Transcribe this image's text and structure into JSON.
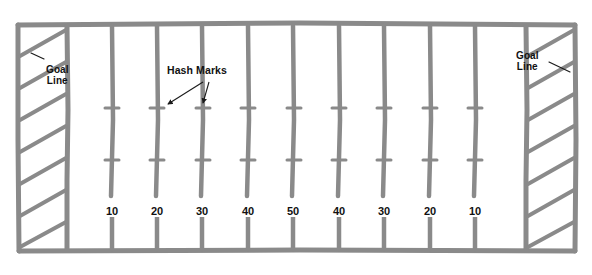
{
  "diagram": {
    "type": "football-field-plan",
    "colors": {
      "line": "#8a8a8a",
      "line_dark": "#7b7b7b",
      "background": "#ffffff",
      "text": "#111111",
      "annotation": "#1a1a1a"
    },
    "labels": {
      "goal_line_left": "Goal\nLine",
      "goal_line_left_line1": "Goal",
      "goal_line_left_line2": "Line",
      "goal_line_right_line1": "Goal",
      "goal_line_right_line2": "Line",
      "hash_marks": "Hash Marks"
    },
    "yard_numbers": [
      {
        "label": "10",
        "x": 112
      },
      {
        "label": "20",
        "x": 157
      },
      {
        "label": "30",
        "x": 202
      },
      {
        "label": "40",
        "x": 248
      },
      {
        "label": "50",
        "x": 293
      },
      {
        "label": "40",
        "x": 339
      },
      {
        "label": "30",
        "x": 384
      },
      {
        "label": "20",
        "x": 430
      },
      {
        "label": "10",
        "x": 475
      }
    ],
    "yard_number_y": 205,
    "field": {
      "outer_left": 18,
      "outer_top": 23,
      "outer_right": 575,
      "outer_bottom": 251,
      "goal_line_left_x": 67,
      "goal_line_right_x": 526,
      "endzone_stripes_left": 7,
      "endzone_stripes_right": 7,
      "hash_row_top_y": 108,
      "hash_row_bottom_y": 160,
      "hash_width": 13
    },
    "annotation_arrows": [
      {
        "from_x": 205,
        "from_y": 82,
        "to_x": 166,
        "to_y": 106,
        "target": "hash-mark-20-upper"
      },
      {
        "from_x": 212,
        "from_y": 82,
        "to_x": 203,
        "to_y": 106,
        "target": "hash-mark-30-upper"
      }
    ],
    "goal_line_leader_left": {
      "x1": 44,
      "y1": 60,
      "x2": 33,
      "y2": 54
    },
    "goal_line_leader_right": {
      "x1": 548,
      "y1": 60,
      "x2": 566,
      "y2": 70
    }
  }
}
